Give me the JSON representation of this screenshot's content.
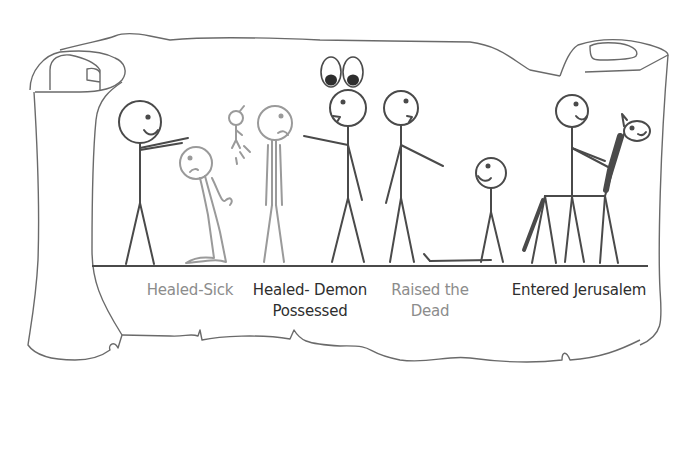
{
  "diagram": {
    "type": "illustrated scroll timeline",
    "background": "#ffffff",
    "colors": {
      "ink_dark": "#4a4a4a",
      "ink_gray": "#9a9a9a",
      "label_dark": "#2e2e2e",
      "label_gray": "#8c8c8c",
      "scroll_outline": "#6a6a6a"
    },
    "scenes": [
      {
        "id": "healed-sick",
        "label": "Healed-Sick",
        "label_color": "gray"
      },
      {
        "id": "healed-demon-possessed",
        "label_line1": "Healed- Demon",
        "label_line2": "Possessed",
        "label_color": "dark"
      },
      {
        "id": "raised-the-dead",
        "label_line1": "Raised the",
        "label_line2": "Dead",
        "label_color": "gray"
      },
      {
        "id": "entered-jerusalem",
        "label": "Entered Jerusalem",
        "label_color": "dark"
      }
    ]
  }
}
